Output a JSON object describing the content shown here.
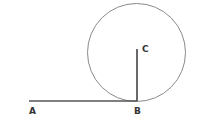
{
  "diagram": {
    "type": "geometry",
    "points": {
      "A": {
        "label": "A",
        "x": 29,
        "y": 101
      },
      "B": {
        "label": "B",
        "x": 137,
        "y": 101
      },
      "C": {
        "label": "C",
        "x": 137,
        "y": 49
      }
    },
    "circle": {
      "cx": 136.5,
      "cy": 52.5,
      "r": 49
    },
    "segments": [
      {
        "from": "A",
        "to": "B"
      },
      {
        "from": "C",
        "to": "B"
      }
    ],
    "colors": {
      "line": "#555555",
      "circle": "#888888",
      "label": "#333333"
    }
  }
}
